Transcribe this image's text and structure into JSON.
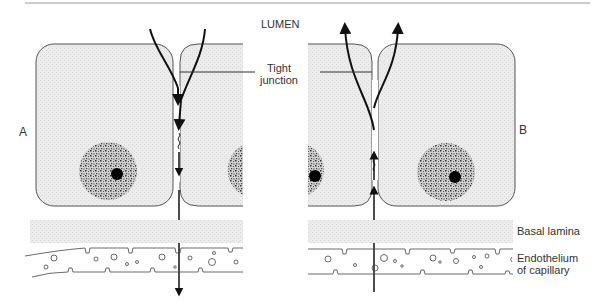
{
  "diagram": {
    "labels": {
      "lumen": "LUMEN",
      "tight_junction_line1": "Tight",
      "tight_junction_line2": "junction",
      "panel_a": "A",
      "panel_b": "B",
      "basal_lamina": "Basal lamina",
      "endothelium_line1": "Endothelium",
      "endothelium_line2": "of capillary"
    },
    "panels": [
      {
        "id": "A",
        "direction": "lumen-to-capillary",
        "arrow": "down"
      },
      {
        "id": "B",
        "direction": "capillary-to-lumen",
        "arrow": "up"
      }
    ],
    "colors": {
      "cell_fill": "#ebebeb",
      "outline": "#555555",
      "arrow": "#111111",
      "basal_lamina": "#e6e6e6"
    }
  }
}
